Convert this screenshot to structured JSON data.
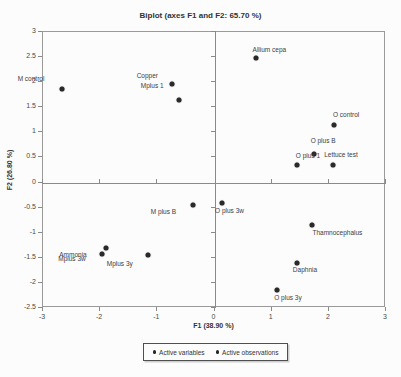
{
  "colors": {
    "background": "#fcfcfc",
    "axis_line": "#9a9a9a",
    "crosshair": "#8a8a8a",
    "point": "#2a2a2a",
    "text": "#3d3d3d"
  },
  "chart_data": {
    "type": "scatter",
    "title": "Biplot (axes F1 and F2: 65.70 %)",
    "xlabel": "F1 (38.90 %)",
    "ylabel": "F2 (26.80 %)",
    "xlim": [
      -3,
      3
    ],
    "ylim": [
      -2.5,
      3
    ],
    "xticks": [
      -3,
      -2,
      -1,
      0,
      1,
      2,
      3
    ],
    "yticks": [
      3,
      2.5,
      2,
      1.5,
      1,
      0.5,
      0,
      -0.5,
      -1,
      -1.5,
      -2,
      -2.5
    ],
    "grid": false,
    "crosshair_at_origin": true,
    "legend_position": "bottom-center",
    "legend": [
      {
        "label": "Active variables",
        "marker": "dot"
      },
      {
        "label": "Active observations",
        "marker": "dot"
      }
    ],
    "points": [
      {
        "label": "M control",
        "x": -2.65,
        "y": 1.85,
        "dx": -31,
        "dy": -11
      },
      {
        "label": "Copper",
        "x": -0.72,
        "y": 1.95,
        "dx": -25,
        "dy": -9
      },
      {
        "label": "Mplus 1",
        "x": -0.6,
        "y": 1.63,
        "dx": -27,
        "dy": -15
      },
      {
        "label": "Allium cepa",
        "x": 0.75,
        "y": 2.47,
        "dx": 13,
        "dy": -9
      },
      {
        "label": "O control",
        "x": 2.11,
        "y": 1.12,
        "dx": 12,
        "dy": -11
      },
      {
        "label": "O plus B",
        "x": 1.76,
        "y": 0.54,
        "dx": 9,
        "dy": -14
      },
      {
        "label": "O plus 1",
        "x": 1.46,
        "y": 0.33,
        "dx": 11,
        "dy": -10
      },
      {
        "label": "Lettuce test",
        "x": 2.09,
        "y": 0.33,
        "dx": 8,
        "dy": -11
      },
      {
        "label": "M plus B",
        "x": -0.35,
        "y": -0.46,
        "dx": -30,
        "dy": 6
      },
      {
        "label": "O plus 3w",
        "x": 0.14,
        "y": -0.42,
        "dx": 8,
        "dy": 7
      },
      {
        "label": "Thamnocephalus",
        "x": 1.73,
        "y": -0.86,
        "dx": 25,
        "dy": 7
      },
      {
        "label": "Daphnia",
        "x": 1.46,
        "y": -1.62,
        "dx": 8,
        "dy": 6
      },
      {
        "label": "O plus 3y",
        "x": 1.11,
        "y": -2.16,
        "dx": 11,
        "dy": 7
      },
      {
        "label": "Ammonia",
        "x": -1.88,
        "y": -1.33,
        "dx": -33,
        "dy": 6
      },
      {
        "label": "Mplus 3w",
        "x": -1.95,
        "y": -1.44,
        "dx": -30,
        "dy": 4
      },
      {
        "label": "Mplus 3y",
        "x": -1.15,
        "y": -1.46,
        "dx": -28,
        "dy": 8
      }
    ]
  }
}
